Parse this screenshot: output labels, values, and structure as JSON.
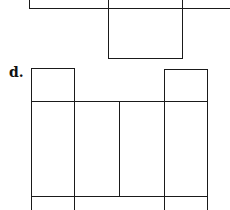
{
  "figure": {
    "label": "d.",
    "line_color": "#1a1a1a",
    "background": "#ffffff"
  },
  "upper_partial_net": {
    "top_strip": {
      "x": [
        29,
        230
      ],
      "y": [
        0,
        8
      ]
    },
    "bottom_flap": {
      "x": [
        108,
        182
      ],
      "y": [
        8,
        58
      ]
    }
  },
  "net_d": {
    "top_flaps": [
      {
        "x": [
          31,
          74
        ],
        "y": [
          68,
          101
        ]
      },
      {
        "x": [
          164,
          207
        ],
        "y": [
          69,
          101
        ]
      }
    ],
    "main_row": {
      "x": [
        31,
        207
      ],
      "y": [
        101,
        196
      ],
      "dividers_x": [
        74,
        119,
        164
      ]
    },
    "bottom_flaps_partial": {
      "y_start": 196,
      "dividers_x": [
        31,
        74,
        164,
        207
      ]
    }
  }
}
